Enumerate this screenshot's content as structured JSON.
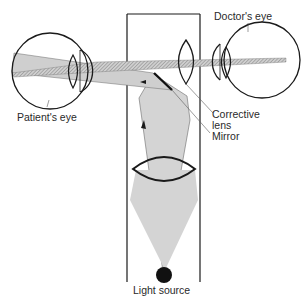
{
  "diagram": {
    "labels": {
      "doctors_eye": "Doctor's eye",
      "patients_eye": "Patient's eye",
      "corrective_lens_line1": "Corrective",
      "corrective_lens_line2": "lens",
      "mirror": "Mirror",
      "light_source": "Light source"
    },
    "components": [
      "patient-eye",
      "doctor-eye",
      "instrument-housing",
      "corrective-lens",
      "mirror",
      "condenser-lens",
      "light-source",
      "light-beam",
      "reflected-beam"
    ],
    "colors": {
      "stroke": "#1a1a1a",
      "beam_fill": "#d4d4d4",
      "hatch": "#8a8a8a",
      "light_source": "#111111"
    }
  }
}
